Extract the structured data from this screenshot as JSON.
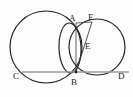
{
  "figure": {
    "background_color": "#fdfdfd",
    "stroke_color": "#221f1f",
    "chord_color": "#9a9a9a",
    "labels": {
      "A": "A",
      "B": "B",
      "C": "C",
      "D": "D",
      "E": "E",
      "F": "F"
    },
    "points": {
      "A": {
        "x": 76,
        "y": 23,
        "label_x": 69,
        "label_y": 15
      },
      "B": {
        "x": 76,
        "y": 72,
        "label_x": 72,
        "label_y": 79
      },
      "C": {
        "x": 22,
        "y": 72,
        "label_x": 13,
        "label_y": 73
      },
      "D": {
        "x": 124,
        "y": 72,
        "label_x": 118,
        "label_y": 73
      },
      "E": {
        "x": 83,
        "y": 47,
        "label_x": 85,
        "label_y": 43
      },
      "F": {
        "x": 92,
        "y": 23,
        "label_x": 88,
        "label_y": 14
      }
    },
    "shapes": {
      "left_circle": {
        "cx": 46,
        "cy": 47,
        "r": 36
      },
      "right_circle": {
        "cx": 97,
        "cy": 47,
        "r": 28
      },
      "small_circle": {
        "cx": 69,
        "cy": 48,
        "r": 26
      },
      "chord_CD": {
        "x1": 22,
        "y1": 72,
        "x2": 129,
        "y2": 72
      },
      "segment_FB": {
        "x1": 92,
        "y1": 22,
        "x2": 76,
        "y2": 72
      }
    }
  }
}
